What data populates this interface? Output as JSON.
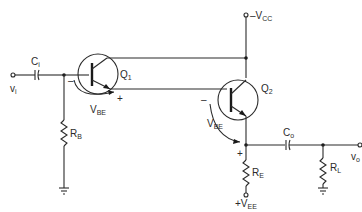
{
  "diagram": {
    "type": "circuit-schematic",
    "labels": {
      "input": {
        "main": "v",
        "sub": "i"
      },
      "output": {
        "main": "v",
        "sub": "o"
      },
      "input_cap": {
        "main": "C",
        "sub": "i"
      },
      "output_cap": {
        "main": "C",
        "sub": "o"
      },
      "q1": {
        "main": "Q",
        "sub": "1"
      },
      "q2": {
        "main": "Q",
        "sub": "2"
      },
      "vcc": {
        "prefix": "–V",
        "sub": "CC"
      },
      "vee": {
        "prefix": "+V",
        "sub": "EE"
      },
      "rb": {
        "main": "R",
        "sub": "B"
      },
      "re": {
        "main": "R",
        "sub": "E"
      },
      "rl": {
        "main": "R",
        "sub": "L"
      },
      "vbe1": {
        "main": "V",
        "sub": "BE",
        "minus": "–",
        "plus": "+"
      },
      "vbe2": {
        "main": "V",
        "sub": "BE",
        "minus": "–",
        "plus": "+"
      }
    },
    "components": [
      "Ci",
      "Q1",
      "Q2",
      "RB",
      "RE",
      "RL",
      "Co"
    ],
    "colors": {
      "line": "#2b2b2b",
      "background": "#ffffff"
    }
  }
}
